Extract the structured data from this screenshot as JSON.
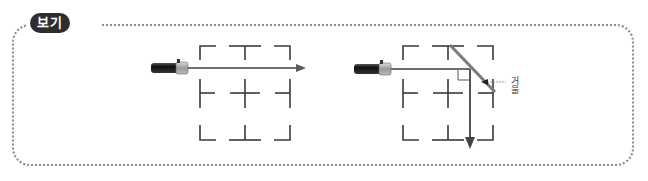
{
  "badge": {
    "label": "보기"
  },
  "figures": [
    {
      "id": "left",
      "description": "flashlight beam passing straight through 3x3 grid",
      "grid": {
        "x": 200,
        "y": 45,
        "width": 91,
        "height": 95
      },
      "beam": {
        "from": [
          190,
          68
        ],
        "to": [
          305,
          68
        ]
      }
    },
    {
      "id": "right",
      "description": "flashlight beam reflected downward by mirror",
      "grid": {
        "x": 403,
        "y": 45,
        "width": 91,
        "height": 95
      },
      "mirror_label": "거울"
    }
  ],
  "colors": {
    "frame": "#8a8a8a",
    "badge_bg": "#2e2e2e",
    "grid": "#3a3a3a",
    "beam": "#6e6e6e",
    "mirror": "#7a7a7a"
  }
}
